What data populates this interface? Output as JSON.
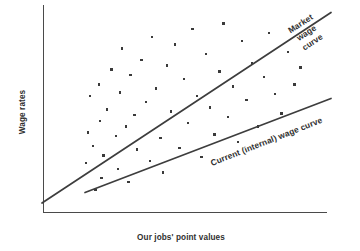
{
  "chart_data": {
    "type": "scatter",
    "title": "",
    "subtitle": "",
    "xlabel": "Our jobs' point values",
    "ylabel": "Wage rates",
    "xlim": [
      0,
      100
    ],
    "ylim": [
      0,
      100
    ],
    "grid": false,
    "legend_position": "inline-annotations",
    "axis_ticks": {
      "x": [],
      "y": []
    },
    "points": {
      "name": "Job wage observations",
      "marker": "square",
      "color": "#3a3a3a",
      "x": [
        12.6,
        13.3,
        14.1,
        15.2,
        16.1,
        17.3,
        17.8,
        18.4,
        19.0,
        20.3,
        22.1,
        23.6,
        24.4,
        25.2,
        26.0,
        27.5,
        28.3,
        29.0,
        30.6,
        31.4,
        33.2,
        34.8,
        36.3,
        37.1,
        38.6,
        40.2,
        41.0,
        42.5,
        44.1,
        45.6,
        47.2,
        48.8,
        50.3,
        52.1,
        53.8,
        55.4,
        57.0,
        58.6,
        60.2,
        62.0,
        63.5,
        65.1,
        67.0,
        68.8,
        70.4,
        72.1,
        74.0,
        76.2,
        78.5,
        80.3,
        82.6,
        85.0,
        87.4,
        89.8,
        92.0
      ],
      "y": [
        22.0,
        38.0,
        57.0,
        31.0,
        8.0,
        63.0,
        44.0,
        14.0,
        26.0,
        50.0,
        71.0,
        36.0,
        19.0,
        59.0,
        82.0,
        41.0,
        12.0,
        68.0,
        47.0,
        29.0,
        76.0,
        54.0,
        23.0,
        88.0,
        61.0,
        35.0,
        17.0,
        73.0,
        49.0,
        84.0,
        30.0,
        66.0,
        43.0,
        92.0,
        57.0,
        25.0,
        79.0,
        51.0,
        37.0,
        70.0,
        95.0,
        46.0,
        62.0,
        33.0,
        86.0,
        55.0,
        74.0,
        41.0,
        67.0,
        90.0,
        58.0,
        48.0,
        80.0,
        63.0,
        72.0
      ]
    },
    "series": [
      {
        "name": "Market wage curve",
        "type": "line",
        "label": "Market wage curve",
        "label_lines": [
          "Market",
          "wage",
          "curve"
        ],
        "color": "#3d3d3d",
        "x": [
          0,
          100
        ],
        "y": [
          3.5,
          96.0
        ],
        "slope_desc": "steep"
      },
      {
        "name": "Current (internal) wage curve",
        "type": "line",
        "label": "Current (internal) wage curve",
        "label_lines": [
          "Current (internal) wage curve"
        ],
        "color": "#3d3d3d",
        "x": [
          15,
          100
        ],
        "y": [
          9.0,
          55.0
        ],
        "slope_desc": "shallow"
      }
    ]
  },
  "annotations": {
    "market_curve_label": "Market wage curve",
    "market_curve_label_line1": "Market",
    "market_curve_label_line2": "wage",
    "market_curve_label_line3": "curve",
    "current_curve_label": "Current (internal) wage curve"
  },
  "axes": {
    "x_title": "Our jobs' point values",
    "y_title": "Wage rates"
  }
}
